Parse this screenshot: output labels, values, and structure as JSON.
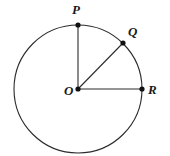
{
  "figure": {
    "background_color": "#ffffff",
    "stroke_color": "#2b2b2b",
    "point_color": "#111111",
    "label_color": "#1a1a1a",
    "circle": {
      "center_x": 78,
      "center_y": 89,
      "radius": 64,
      "stroke_width": 1.1
    },
    "points": [
      {
        "id": "O",
        "label": "O",
        "x": 78,
        "y": 89,
        "dot_radius": 2.6,
        "label_x": 64,
        "label_y": 95
      },
      {
        "id": "P",
        "label": "P",
        "x": 78,
        "y": 25,
        "dot_radius": 2.6,
        "label_x": 72,
        "label_y": 14
      },
      {
        "id": "Q",
        "label": "Q",
        "x": 123,
        "y": 43,
        "dot_radius": 2.6,
        "label_x": 128,
        "label_y": 36
      },
      {
        "id": "R",
        "label": "R",
        "x": 142,
        "y": 89,
        "dot_radius": 2.6,
        "label_x": 148,
        "label_y": 94
      }
    ],
    "segments": [
      {
        "id": "OP",
        "from": "O",
        "to": "P",
        "x1": 78,
        "y1": 89,
        "x2": 78,
        "y2": 25
      },
      {
        "id": "OQ",
        "from": "O",
        "to": "Q",
        "x1": 78,
        "y1": 89,
        "x2": 123,
        "y2": 43
      },
      {
        "id": "OR",
        "from": "O",
        "to": "R",
        "x1": 78,
        "y1": 89,
        "x2": 142,
        "y2": 89
      }
    ]
  },
  "chart_data": {
    "type": "scatter",
    "xlabel": "",
    "ylabel": "",
    "categories": [
      "O",
      "P",
      "Q",
      "R"
    ],
    "series": [
      {
        "name": "points",
        "values": [
          {
            "label": "O",
            "x": 78,
            "y": 89,
            "role": "center"
          },
          {
            "label": "P",
            "x": 78,
            "y": 25,
            "role": "on-circle",
            "angle_deg": 90
          },
          {
            "label": "Q",
            "x": 123,
            "y": 43,
            "role": "on-circle",
            "angle_deg": 45
          },
          {
            "label": "R",
            "x": 142,
            "y": 89,
            "role": "on-circle",
            "angle_deg": 0
          }
        ]
      }
    ],
    "radius": 64,
    "grid": false,
    "legend": "none"
  }
}
